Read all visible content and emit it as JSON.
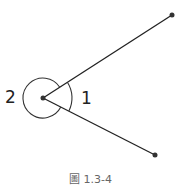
{
  "figure": {
    "caption": "圖 1.3-4",
    "angle_labels": {
      "reflex": "2",
      "acute": "1"
    },
    "vertex": [
      43,
      98
    ],
    "ray_endpoints": [
      [
        172,
        15
      ],
      [
        155,
        155
      ]
    ],
    "line_color": "#222222"
  }
}
